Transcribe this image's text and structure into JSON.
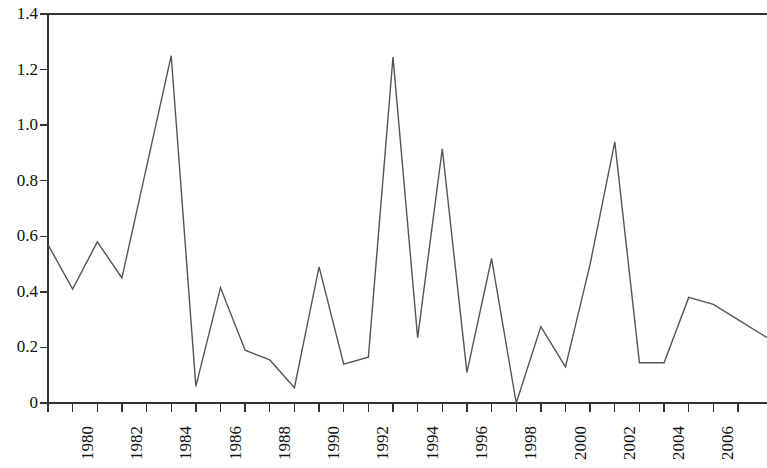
{
  "chart_data": {
    "type": "line",
    "title": "",
    "subtitle": "",
    "xlabel": "",
    "ylabel": "",
    "grid": false,
    "legend": "none",
    "line_color": "#555555",
    "axis_color": "#333333",
    "background": "#ffffff",
    "xlim": [
      1979,
      2007
    ],
    "ylim": [
      0,
      1.4
    ],
    "y_ticks": [
      0,
      0.2,
      0.4,
      0.6,
      0.8,
      1.0,
      1.2,
      1.4
    ],
    "y_tick_labels": [
      "0",
      "0.2",
      "0.4",
      "0.6",
      "0.8",
      "1.0",
      "1.2",
      "1.4"
    ],
    "x_ticks": [
      1979,
      1980,
      1981,
      1982,
      1983,
      1984,
      1985,
      1986,
      1987,
      1988,
      1989,
      1990,
      1991,
      1992,
      1993,
      1994,
      1995,
      1996,
      1997,
      1998,
      1999,
      2000,
      2001,
      2002,
      2003,
      2004,
      2005,
      2006,
      2007
    ],
    "x_tick_labels": [
      "",
      "1980",
      "",
      "1982",
      "",
      "1984",
      "",
      "1986",
      "",
      "1988",
      "",
      "1990",
      "",
      "1992",
      "",
      "1994",
      "",
      "1996",
      "",
      "1998",
      "",
      "2000",
      "",
      "2002",
      "",
      "2004",
      "",
      "2006",
      ""
    ],
    "x": [
      1979,
      1980,
      1981,
      1982,
      1983,
      1984,
      1985,
      1986,
      1987,
      1988,
      1989,
      1990,
      1991,
      1992,
      1993,
      1994,
      1995,
      1996,
      1997,
      1998,
      1999,
      2000,
      2001,
      2002,
      2003,
      2004,
      2005,
      2006,
      2007
    ],
    "values": [
      0.57,
      0.41,
      0.58,
      0.45,
      0.85,
      1.25,
      0.06,
      0.415,
      0.19,
      0.155,
      0.055,
      0.49,
      0.14,
      0.165,
      1.245,
      0.235,
      0.915,
      0.11,
      0.52,
      0.0,
      0.275,
      0.13,
      0.5,
      0.94,
      0.145,
      0.145,
      0.38,
      0.355,
      0.3
    ],
    "series": [
      {
        "name": "series-1",
        "values": [
          0.57,
          0.41,
          0.58,
          0.45,
          0.85,
          1.25,
          0.06,
          0.415,
          0.19,
          0.155,
          0.055,
          0.49,
          0.14,
          0.165,
          1.245,
          0.235,
          0.915,
          0.11,
          0.52,
          0.0,
          0.275,
          0.13,
          0.5,
          0.94,
          0.145,
          0.145,
          0.38,
          0.355,
          0.3
        ]
      }
    ]
  }
}
